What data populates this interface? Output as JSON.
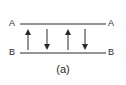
{
  "diagram": {
    "caption": "(a)",
    "lines": [
      {
        "id": "A",
        "left_label": "A",
        "right_label": "A"
      },
      {
        "id": "B",
        "left_label": "B",
        "right_label": "B"
      }
    ],
    "arrows": [
      {
        "direction": "up"
      },
      {
        "direction": "down"
      },
      {
        "direction": "up"
      },
      {
        "direction": "down"
      }
    ],
    "colors": {
      "stroke": "#2a2a2a",
      "background": "#ffffff"
    }
  }
}
